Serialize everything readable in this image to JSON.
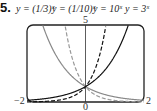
{
  "problem_number": "5.",
  "chart_data": {
    "type": "line",
    "title": "",
    "series": [
      {
        "name": "y = (1/3)^x",
        "label": "y = (1/3)^x",
        "style": "solid-gray",
        "base": 0.3333
      },
      {
        "name": "y = (1/10)^x",
        "label": "y = (1/10)^x",
        "style": "dashed-gray",
        "base": 0.1
      },
      {
        "name": "y = 10^x",
        "label": "y = 10^x",
        "style": "dashed-black",
        "base": 10
      },
      {
        "name": "y = 3^x",
        "label": "y = 3^x",
        "style": "solid-black",
        "base": 3
      }
    ],
    "xlim": [
      -2,
      2
    ],
    "ylim": [
      0,
      5
    ],
    "x_tick_labels": [
      "-2",
      "0",
      "2"
    ],
    "y_tick_labels": [
      "5"
    ],
    "grid": false,
    "legend_position": "top labels",
    "intersection": [
      0,
      1
    ]
  },
  "labels": {
    "one_third": "y = (1/3)ˣ",
    "one_tenth": "y = (1/10)ˣ",
    "ten": "y = 10ˣ",
    "three": "y = 3ˣ"
  },
  "ticks": {
    "xmin": "−2",
    "xmax": "2",
    "xzero": "0",
    "ymax": "5"
  }
}
